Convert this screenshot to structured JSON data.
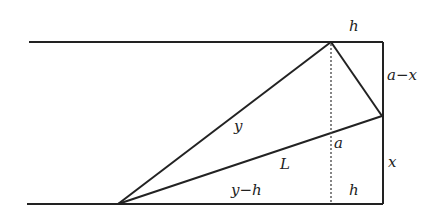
{
  "diagram": {
    "labels": {
      "top_h": "h",
      "right_upper": "a−x",
      "fold_y": "y",
      "crease_L": "L",
      "a_mark": "a",
      "right_lower": "x",
      "bottom_ymh": "y−h",
      "bottom_h": "h"
    },
    "colors": {
      "line": "#222222",
      "dashed": "#444444",
      "background": "#ffffff"
    }
  }
}
